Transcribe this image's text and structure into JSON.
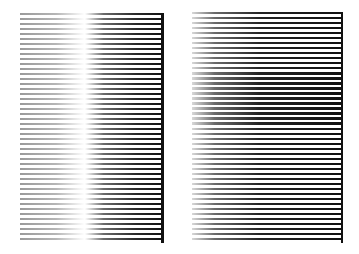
{
  "figure": {
    "panels": [
      {
        "id": "left",
        "line_count": 46,
        "gradient": "lines fade from light gray on left to dark/black on right, with a white luminance band near 45% width",
        "colors": {
          "light": "#c8c8c8",
          "mid": "#ffffff",
          "dark": "#111111"
        }
      },
      {
        "id": "right",
        "line_count": 46,
        "gradient": "lines fade from white on left to solid black on right",
        "colors": {
          "light": "#ffffff",
          "dark": "#111111"
        }
      }
    ]
  }
}
